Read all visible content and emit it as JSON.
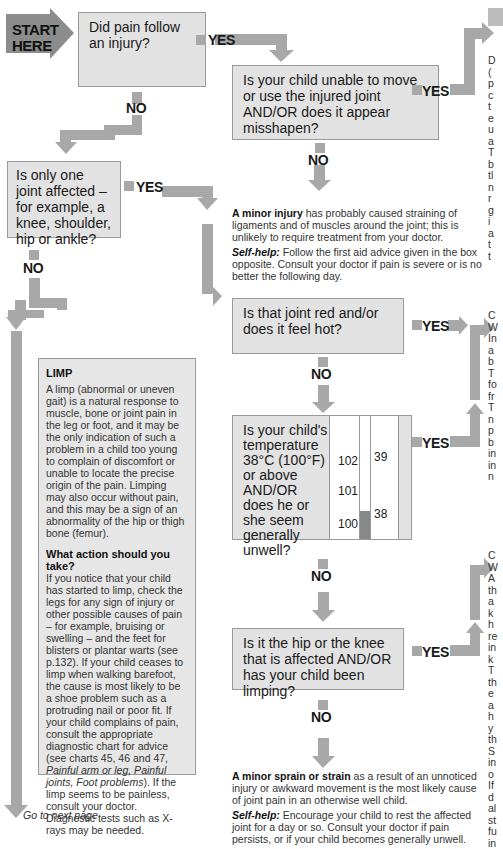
{
  "start": {
    "label_line1": "START",
    "label_line2": "HERE"
  },
  "questions": {
    "q1": "Did pain follow an injury?",
    "q2": "Is your child unable to move or use the injured joint AND/OR does it appear misshapen?",
    "q3": "Is only one joint affected – for example, a knee, shoulder, hip or ankle?",
    "q4": "Is that joint red and/or does it feel hot?",
    "q5": "Is your child's temperature 38°C (100°F) or above AND/OR does he or she seem generally unwell?",
    "q6": "Is it the hip or the knee that is affected AND/OR has your child been limping?"
  },
  "labels": {
    "yes": "YES",
    "no": "NO"
  },
  "thermometer": {
    "fahrenheit": [
      "102",
      "101",
      "100"
    ],
    "celsius": [
      "39",
      "38"
    ]
  },
  "outcomes": {
    "minor_injury": {
      "bold": "A minor injury",
      "text": " has probably caused straining of ligaments and of muscles around the joint; this is unlikely to require treatment from your doctor.",
      "selfhelp_label": "Self-help:",
      "selfhelp_text": " Follow the first aid advice given in the box opposite. Consult your doctor if pain is severe or is no better the following day."
    },
    "minor_sprain": {
      "bold": "A minor sprain or strain",
      "text": " as a result of an unnoticed injury or awkward movement is the most likely cause of joint pain in an otherwise well child.",
      "selfhelp_label": "Self-help:",
      "selfhelp_text": " Encourage your child to rest the affected joint for a day or so. Consult your doctor if pain persists, or if your child becomes generally unwell."
    }
  },
  "limp_box": {
    "title": "LIMP",
    "para1": "A limp (abnormal or uneven gait) is a natural response to muscle, bone or joint pain in the leg or foot, and it may be the only indication of such a problem in a child too young to complain of discomfort or unable to locate the precise origin of the pain. Limping may also occur without pain, and this may be a sign of an abnormality of the hip or thigh bone (femur).",
    "subtitle": "What action should you take?",
    "para2_a": "If you notice that your child has started to limp, check the legs for any sign of injury or other possible causes of pain – for example, bruising or swelling – and the feet for blisters or plantar warts (see p.132). If your child ceases to limp when walking barefoot, the cause is most likely to be a shoe problem such as a protruding nail or poor fit. If your child complains of pain, consult the appropriate diagnostic chart for advice (see charts 45, 46 and 47, ",
    "para2_italic": "Painful arm or leg, Painful joints, Foot problems",
    "para2_b": "). If the limp seems to be painless, consult your doctor. Diagnostic tests such as X-rays may be needed."
  },
  "go_next": "Go to next page",
  "right_column": {
    "block1": [
      "D",
      "(",
      "p",
      "c",
      "t",
      "e",
      "u",
      "a",
      "T",
      "b",
      "tl",
      "n",
      "r",
      "g",
      "i",
      "a",
      "t",
      "t"
    ],
    "block2": [
      "C",
      "W",
      "In",
      "a",
      "b",
      "T",
      "fo",
      "fr",
      "T",
      "n",
      "p",
      "b",
      "in",
      "in",
      "n"
    ],
    "block3": [
      "C",
      "W",
      "A",
      "th",
      "a",
      "k",
      "h",
      "re",
      "in",
      "k",
      "T",
      "th",
      "e",
      "a",
      "h",
      "y",
      "th",
      "S",
      "in",
      "o",
      "If",
      "d",
      "al",
      "st",
      "fu",
      "in"
    ]
  },
  "colors": {
    "box_fill": "#e2e2e2",
    "arrow": "#a8a8a8",
    "start": "#8c8c8c",
    "limp_fill": "#e6e6e6"
  }
}
